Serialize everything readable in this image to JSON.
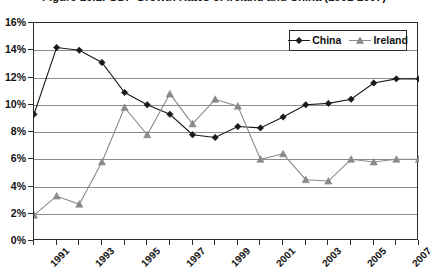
{
  "chart_data": {
    "type": "line",
    "title": "Figure 16.1: GDP Growth Rates of Ireland and China (1991-2007)",
    "xlabel": "",
    "ylabel": "",
    "x": [
      1991,
      1992,
      1993,
      1994,
      1995,
      1996,
      1997,
      1998,
      1999,
      2000,
      2001,
      2002,
      2003,
      2004,
      2005,
      2006,
      2007,
      2008
    ],
    "categories": [
      "1991",
      "1992",
      "1993",
      "1994",
      "1995",
      "1996",
      "1997",
      "1998",
      "1999",
      "2000",
      "2001",
      "2002",
      "2003",
      "2004",
      "2005",
      "2006",
      "2007",
      "2008"
    ],
    "xtick_labels": [
      "1991",
      "1993",
      "1995",
      "1997",
      "1999",
      "2001",
      "2003",
      "2005",
      "2007"
    ],
    "xtick_values": [
      1991,
      1993,
      1995,
      1997,
      1999,
      2001,
      2003,
      2005,
      2007
    ],
    "ytick_labels": [
      "0%",
      "2%",
      "4%",
      "6%",
      "8%",
      "10%",
      "12%",
      "14%",
      "16%"
    ],
    "ytick_values": [
      0,
      2,
      4,
      6,
      8,
      10,
      12,
      14,
      16
    ],
    "ylim": [
      0,
      16
    ],
    "xlim": [
      1991,
      2008
    ],
    "grid": true,
    "legend_position": "top-right",
    "series": [
      {
        "name": "China",
        "color": "#1a1a1a",
        "marker": "diamond",
        "values": [
          9.3,
          14.2,
          14.0,
          13.1,
          10.9,
          10.0,
          9.3,
          7.8,
          7.6,
          8.4,
          8.3,
          9.1,
          10.0,
          10.1,
          10.4,
          11.6,
          11.9,
          11.9
        ]
      },
      {
        "name": "Ireland",
        "color": "#8a8a8a",
        "marker": "triangle",
        "values": [
          1.9,
          3.3,
          2.7,
          5.8,
          9.8,
          7.8,
          10.8,
          8.6,
          10.4,
          9.9,
          6.0,
          6.4,
          4.5,
          4.4,
          6.0,
          5.8,
          6.0,
          6.0
        ]
      }
    ]
  },
  "legend": {
    "entries": [
      {
        "label": "China"
      },
      {
        "label": "Ireland"
      }
    ]
  }
}
